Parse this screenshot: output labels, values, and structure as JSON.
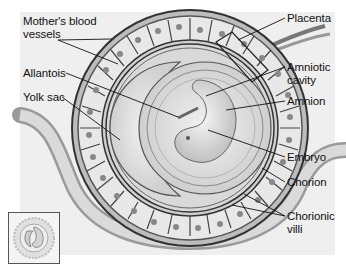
{
  "diagram": {
    "labels": {
      "mothers_blood_vessels": {
        "line1": "Mother's blood",
        "line2": "vessels"
      },
      "allantois": "Allantois",
      "yolk_sac": "Yolk sac",
      "placenta": "Placenta",
      "amniotic_cavity": {
        "line1": "Amniotic",
        "line2": "cavity"
      },
      "amnion": "Amnion",
      "embryo": "Embryo",
      "chorion": "Chorion",
      "chorionic_villi": {
        "line1": "Chorionic",
        "line2": "villi"
      }
    },
    "thumbnail": {
      "icon": "embryo-thumbnail-icon"
    },
    "colors": {
      "background_panel": "#efefef",
      "outline": "#333333",
      "membrane_fill": "#c8c8c8",
      "cavity_fill": "#e2e2e2",
      "text": "#111111"
    }
  }
}
